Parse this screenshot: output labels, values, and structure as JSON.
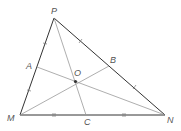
{
  "diagram": {
    "type": "triangle-with-cevians",
    "vertices": [
      "P",
      "M",
      "N"
    ],
    "points": {
      "P": {
        "label": "P"
      },
      "M": {
        "label": "M"
      },
      "N": {
        "label": "N"
      },
      "A": {
        "label": "A",
        "on": "PM",
        "midpoint": true
      },
      "B": {
        "label": "B",
        "on": "PN",
        "midpoint": true
      },
      "C": {
        "label": "C",
        "on": "MN",
        "midpoint": true
      },
      "O": {
        "label": "O",
        "role": "centroid"
      }
    },
    "segments": [
      "PM",
      "PN",
      "MN",
      "PC",
      "MB",
      "NA"
    ],
    "equal_marks": [
      {
        "segments": [
          "PA",
          "AM"
        ],
        "ticks": 1
      },
      {
        "segments": [
          "PB",
          "BN"
        ],
        "ticks": 1
      },
      {
        "segments": [
          "MC",
          "CN"
        ],
        "ticks": 2
      }
    ],
    "colors": {
      "sides": "#333333",
      "medians": "#999999",
      "labels": "#555555"
    }
  }
}
